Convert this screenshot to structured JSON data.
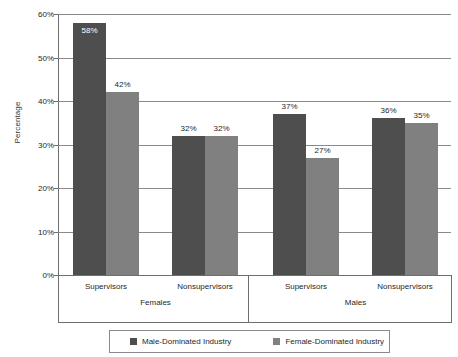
{
  "chart_data": {
    "type": "bar",
    "title": "",
    "xlabel": "",
    "ylabel": "Percentage",
    "ylim": [
      0,
      60
    ],
    "ytick_labels": [
      "0%",
      "10%",
      "20%",
      "30%",
      "40%",
      "50%",
      "60%"
    ],
    "ytick_values": [
      0,
      10,
      20,
      30,
      40,
      50,
      60
    ],
    "grid": true,
    "legend_position": "bottom",
    "categories": [
      "Supervisors",
      "Nonsupervisors",
      "Supervisors",
      "Nonsupervisors"
    ],
    "supergroups": [
      {
        "label": "Females",
        "categories": [
          "Supervisors",
          "Nonsupervisors"
        ]
      },
      {
        "label": "Males",
        "categories": [
          "Supervisors",
          "Nonsupervisors"
        ]
      }
    ],
    "series": [
      {
        "name": "Male-Dominated Industry",
        "color": "#4e4e4e",
        "values": [
          58,
          32,
          37,
          36
        ],
        "labels": [
          "58%",
          "32%",
          "37%",
          "36%"
        ]
      },
      {
        "name": "Female-Dominated Industry",
        "color": "#808080",
        "values": [
          42,
          32,
          27,
          35
        ],
        "labels": [
          "42%",
          "32%",
          "27%",
          "35%"
        ]
      }
    ]
  },
  "legend": {
    "items": [
      {
        "label": "Male-Dominated Industry",
        "color": "#4e4e4e"
      },
      {
        "label": "Female-Dominated Industry",
        "color": "#808080"
      }
    ]
  }
}
